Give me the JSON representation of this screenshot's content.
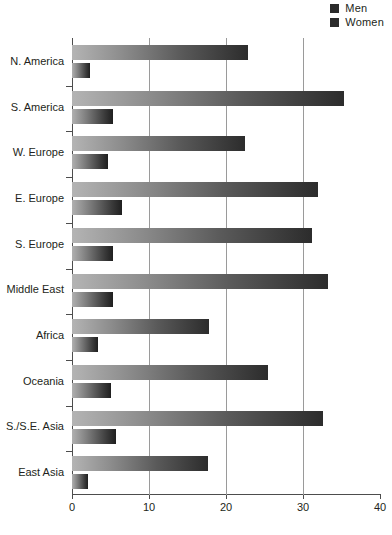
{
  "legend": {
    "position": "top-right",
    "items": [
      {
        "label": "Men",
        "color": "#2b2b2b",
        "icon": "legend-square-icon"
      },
      {
        "label": "Women",
        "color": "#2b2b2b",
        "icon": "legend-square-icon"
      }
    ]
  },
  "axis": {
    "x_ticks": [
      0,
      10,
      20,
      30,
      40
    ],
    "x_tick_labels": [
      "0",
      "10",
      "20",
      "30",
      "40"
    ],
    "xlim": [
      0,
      40
    ],
    "gridlines": [
      10,
      20,
      30
    ]
  },
  "chart_data": {
    "type": "bar",
    "orientation": "horizontal",
    "title": "",
    "subtitle": "",
    "xlabel": "",
    "ylabel": "",
    "xlim": [
      0,
      40
    ],
    "grid": true,
    "legend_position": "top-right",
    "categories": [
      "N. America",
      "S. America",
      "W. Europe",
      "E. Europe",
      "S. Europe",
      "Middle East",
      "Africa",
      "Oceania",
      "S./S.E. Asia",
      "East Asia"
    ],
    "series": [
      {
        "name": "Men",
        "color": "#2b2b2b",
        "values": [
          22.8,
          35.3,
          22.5,
          31.9,
          31.2,
          33.2,
          17.8,
          25.4,
          32.6,
          17.6
        ]
      },
      {
        "name": "Women",
        "color": "#2b2b2b",
        "values": [
          2.3,
          5.3,
          4.7,
          6.5,
          5.3,
          5.3,
          3.4,
          5.1,
          5.7,
          2.1
        ]
      }
    ]
  }
}
